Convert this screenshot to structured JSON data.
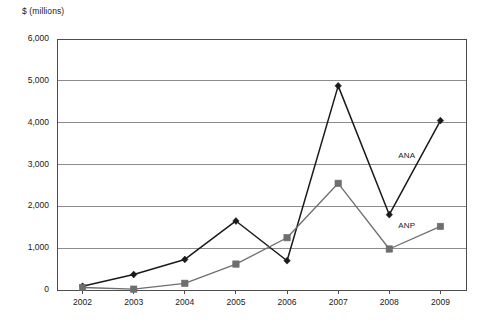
{
  "chart_data": {
    "type": "line",
    "title": "",
    "subtitle": "",
    "xlabel": "",
    "ylabel": "$ (millions)",
    "categories": [
      "2002",
      "2003",
      "2004",
      "2005",
      "2006",
      "2007",
      "2008",
      "2009"
    ],
    "x": [
      2002,
      2003,
      2004,
      2005,
      2006,
      2007,
      2008,
      2009
    ],
    "series": [
      {
        "name": "ANA",
        "color": "#1a1a1a",
        "marker": "diamond",
        "values": [
          90,
          370,
          730,
          1650,
          700,
          4880,
          1800,
          4050
        ]
      },
      {
        "name": "ANP",
        "color": "#6e6e6e",
        "marker": "square",
        "values": [
          60,
          20,
          160,
          620,
          1250,
          2550,
          980,
          1520
        ]
      }
    ],
    "ylim": [
      0,
      6000
    ],
    "ytick_values": [
      0,
      1000,
      2000,
      3000,
      4000,
      5000,
      6000
    ],
    "ytick_labels": [
      "0",
      "1,000",
      "2,000",
      "3,000",
      "4,000",
      "5,000",
      "6,000"
    ],
    "grid": true,
    "grid_axis": "y",
    "legend": "inline-series-labels",
    "annotations": [
      {
        "text": "ANA",
        "series": "ANA"
      },
      {
        "text": "ANP",
        "series": "ANP"
      }
    ]
  },
  "colors": {
    "ana": "#1a1a1a",
    "anp": "#6e6e6e",
    "grid": "#8c8c8c",
    "axis": "#4d4d4d",
    "background": "#ffffff",
    "text": "#1a1a1a"
  }
}
